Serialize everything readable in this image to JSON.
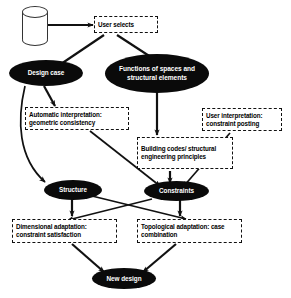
{
  "diagram": {
    "colors": {
      "node_fill": "#0a0a0a",
      "node_text": "#ffffff",
      "box_border": "#111111",
      "box_fill": "#ffffff",
      "edge": "#111111",
      "background": "#ffffff"
    },
    "nodes": [
      {
        "id": "case_base",
        "type": "cylinder",
        "label": ""
      },
      {
        "id": "user_selects",
        "type": "box",
        "label": "User selects"
      },
      {
        "id": "design_case",
        "type": "ellipse",
        "label": "Design case"
      },
      {
        "id": "functions",
        "type": "ellipse",
        "label": "Functions of spaces and structural elements"
      },
      {
        "id": "auto_interp",
        "type": "box",
        "label": "Automatic interpretation: geometric consistency"
      },
      {
        "id": "user_interp",
        "type": "box",
        "label": "User interpretation: constraint posting"
      },
      {
        "id": "building_codes",
        "type": "box",
        "label": "Building codes/ structural engineering principles"
      },
      {
        "id": "structure",
        "type": "ellipse",
        "label": "Structure"
      },
      {
        "id": "constraints",
        "type": "ellipse",
        "label": "Constraints"
      },
      {
        "id": "dimensional",
        "type": "box",
        "label": "Dimensional adaptation: constraint satisfaction"
      },
      {
        "id": "topological",
        "type": "box",
        "label": "Topological adaptation: case combination"
      },
      {
        "id": "new_design",
        "type": "ellipse",
        "label": "New design"
      }
    ],
    "edges": [
      {
        "from": "case_base",
        "to": "user_selects"
      },
      {
        "from": "user_selects",
        "to": "design_case"
      },
      {
        "from": "user_selects",
        "to": "functions"
      },
      {
        "from": "design_case",
        "to": "auto_interp"
      },
      {
        "from": "design_case",
        "to": "structure"
      },
      {
        "from": "functions",
        "to": "building_codes"
      },
      {
        "from": "auto_interp",
        "to": "constraints"
      },
      {
        "from": "user_interp",
        "to": "constraints"
      },
      {
        "from": "building_codes",
        "to": "constraints"
      },
      {
        "from": "structure",
        "to": "dimensional"
      },
      {
        "from": "structure",
        "to": "topological"
      },
      {
        "from": "constraints",
        "to": "topological"
      },
      {
        "from": "constraints",
        "to": "dimensional"
      },
      {
        "from": "dimensional",
        "to": "new_design"
      },
      {
        "from": "topological",
        "to": "new_design"
      }
    ]
  }
}
